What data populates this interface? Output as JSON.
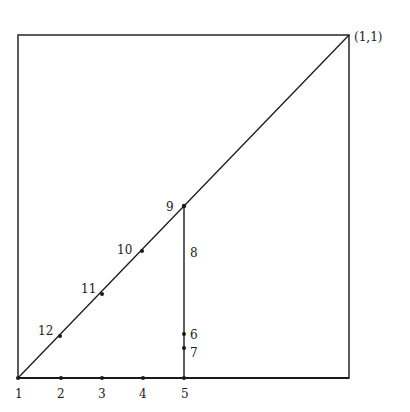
{
  "diagram": {
    "corner_label": "(1,1)",
    "bottom_points": [
      {
        "label": "1",
        "x": 18
      },
      {
        "label": "2",
        "x": 61
      },
      {
        "label": "3",
        "x": 102
      },
      {
        "label": "4",
        "x": 143
      },
      {
        "label": "5",
        "x": 184
      }
    ],
    "vertical_points": [
      {
        "label": "6",
        "y": 334
      },
      {
        "label": "7",
        "y": 348
      }
    ],
    "vertical_segment_label": "8",
    "diagonal_points": [
      {
        "label": "9",
        "x": 184,
        "y": 206
      },
      {
        "label": "10",
        "x": 142,
        "y": 251
      },
      {
        "label": "11",
        "x": 102,
        "y": 294
      },
      {
        "label": "12",
        "x": 60,
        "y": 336
      }
    ],
    "colors": {
      "line": "#1a1a1a",
      "frame": "#333333"
    }
  }
}
